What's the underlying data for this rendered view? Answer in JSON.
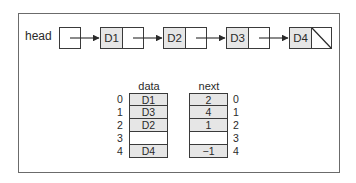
{
  "diagram": {
    "head_label": "head",
    "linked_list": {
      "nodes": [
        {
          "data": "D1",
          "next": "D2"
        },
        {
          "data": "D2",
          "next": "D3"
        },
        {
          "data": "D3",
          "next": "D4"
        },
        {
          "data": "D4",
          "next": null
        }
      ]
    },
    "array_representation": {
      "data_header": "data",
      "next_header": "next",
      "indices": [
        "0",
        "1",
        "2",
        "3",
        "4"
      ],
      "data": [
        "D1",
        "D3",
        "D2",
        "",
        "D4"
      ],
      "next": [
        "2",
        "4",
        "1",
        "",
        "−1"
      ]
    },
    "colors": {
      "cell_fill": "#e6e6e6",
      "border": "#3a3a3a",
      "frame": "#6b6b6b"
    }
  }
}
